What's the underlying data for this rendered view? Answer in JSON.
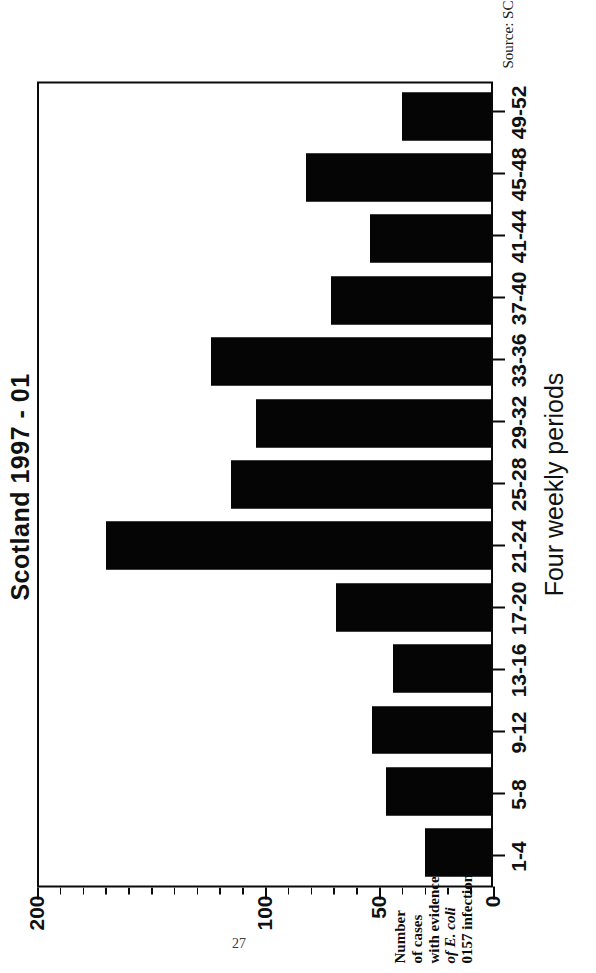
{
  "figure": {
    "title": "Scotland 1997 - 01",
    "source_note": "Source: SCIEH",
    "page_number": "27",
    "yaxis_title_lines": [
      "Number",
      "of cases",
      "with evidence",
      "0157 infection"
    ],
    "yaxis_title_italic_line": "of E. coli"
  },
  "chart_data": {
    "type": "bar",
    "orientation": "vertical",
    "title": "Scotland 1997 - 01",
    "xlabel": "Four weekly periods",
    "ylabel": "Number of cases with evidence of E. coli 0157 infection",
    "categories": [
      "1-4",
      "5-8",
      "9-12",
      "13-16",
      "17-20",
      "21-24",
      "25-28",
      "29-32",
      "33-36",
      "37-40",
      "41-44",
      "45-48",
      "49-52"
    ],
    "values": [
      29,
      46,
      52,
      43,
      68,
      169,
      114,
      103,
      123,
      70,
      53,
      81,
      39
    ],
    "ylim": [
      0,
      200
    ],
    "ytick_major": [
      0,
      50,
      100,
      200
    ],
    "ytick_labels": [
      "0",
      "50",
      "100",
      "200"
    ],
    "ytick_minor_step": 10,
    "grid": false,
    "legend": null,
    "bar_color": "#050505",
    "frame_color": "#0a0a0a",
    "background": "#ffffff"
  }
}
